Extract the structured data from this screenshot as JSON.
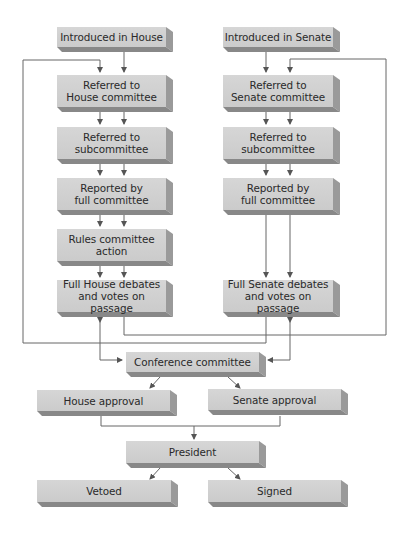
{
  "diagram": {
    "type": "flowchart",
    "colors": {
      "box_face": "#d0d0d0",
      "box_side": "#9a9a9a",
      "box_bottom": "#888888",
      "connector": "#555555",
      "text": "#2a2a2a"
    },
    "house": {
      "introduced": "Introduced in House",
      "referred_committee": "Referred to\nHouse committee",
      "referred_subcommittee": "Referred to\nsubcommittee",
      "reported": "Reported by\nfull committee",
      "rules": "Rules committee\naction",
      "full_debate": "Full House debates\nand votes on passage"
    },
    "senate": {
      "introduced": "Introduced in Senate",
      "referred_committee": "Referred to\nSenate committee",
      "referred_subcommittee": "Referred to\nsubcommittee",
      "reported": "Reported by\nfull committee",
      "full_debate": "Full Senate debates\nand votes on passage"
    },
    "conference": "Conference committee",
    "house_approval": "House approval",
    "senate_approval": "Senate approval",
    "president": "President",
    "vetoed": "Vetoed",
    "signed": "Signed"
  }
}
